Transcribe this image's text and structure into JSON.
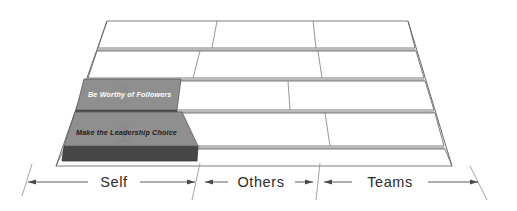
{
  "diagram": {
    "type": "perspective-grid",
    "colors": {
      "block_top": "#8f8f8f",
      "block_side": "#474747",
      "slab_fill": "#ffffff",
      "slab_stroke": "#6e6e6e",
      "gap_fill": "#b9b9b9",
      "axis_text": "#2b2b2b",
      "label_light": "#ffffff",
      "label_dark": "#1c1c1c"
    }
  },
  "blocks": [
    {
      "id": "block-2",
      "number": "2",
      "label": "Be Worthy of Followers",
      "text_color": "light",
      "row": 3,
      "column": "Self"
    },
    {
      "id": "block-1",
      "number": "1",
      "label": "Make the Leadership Choice",
      "text_color": "dark",
      "row": 4,
      "column": "Self"
    }
  ],
  "axis": {
    "name": "scope-axis",
    "segments": [
      {
        "label": "Self"
      },
      {
        "label": "Others"
      },
      {
        "label": "Teams"
      }
    ]
  },
  "rows": [
    {
      "index": 0,
      "cells": 3
    },
    {
      "index": 1,
      "cells": 3
    },
    {
      "index": 2,
      "cells": 3
    },
    {
      "index": 3,
      "cells": 3
    },
    {
      "index": 4,
      "cells": 3
    }
  ]
}
